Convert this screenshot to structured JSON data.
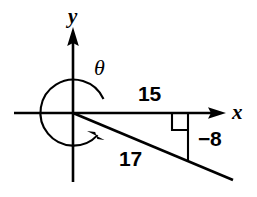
{
  "figure": {
    "kind": "coordinate-plane-angle-diagram",
    "background_color": "#ffffff",
    "stroke_color": "#000000",
    "axes": {
      "x_axis_label": "x",
      "y_axis_label": "y",
      "origin": {
        "x": 73,
        "y": 113
      }
    },
    "angle": {
      "symbol": "θ",
      "arc_direction": "clockwise-sweep-reflex",
      "arc_radius": 33
    },
    "labels": {
      "adjacent_leg": "15",
      "hypotenuse": "17",
      "opposite_leg": "−8"
    },
    "markers": {
      "right_angle": "right-angle-square"
    }
  }
}
